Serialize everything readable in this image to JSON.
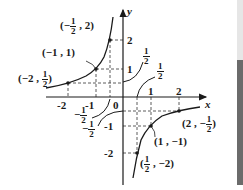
{
  "figure": {
    "title": "",
    "axes": {
      "x_label": "x",
      "y_label": "y",
      "origin_label": "0",
      "x_ticks": [
        "-2",
        "-1",
        "1",
        "2"
      ],
      "y_ticks": [
        "2",
        "1",
        "-1",
        "-2"
      ]
    },
    "curves": [
      {
        "name": "y = -1/x (left branch)",
        "points": [
          [
            -2,
            0.5
          ],
          [
            -1,
            1
          ],
          [
            -0.5,
            2
          ]
        ]
      },
      {
        "name": "y = -1/x (right branch)",
        "points": [
          [
            0.5,
            -2
          ],
          [
            1,
            -1
          ],
          [
            2,
            -0.5
          ]
        ]
      },
      {
        "name": "y = -1/(2x) (left branch)",
        "label": "-1/2"
      },
      {
        "name": "y = -1/(2x) (right branch)",
        "label": "-1/2"
      },
      {
        "name": "y = 1/(2x) (upper branch)",
        "label": "1/2"
      },
      {
        "name": "y = 1/(2x) upper-right branch",
        "label": "1/2"
      }
    ],
    "point_labels": {
      "p1": {
        "open": "(",
        "pre": "−",
        "num": "1",
        "den": "2",
        "sep": ",",
        "y": "2",
        "close": ")"
      },
      "p2": "(−1 , 1)",
      "p3": {
        "open": "(",
        "x": "−2",
        "sep": ",",
        "num": "1",
        "den": "2",
        "close": ")"
      },
      "p4": "(1 , −1)",
      "p5": {
        "open": "(",
        "x": "2",
        "sep": ",",
        "pre": "−",
        "num": "1",
        "den": "2",
        "close": ")"
      },
      "p6": {
        "open": "(",
        "num": "1",
        "den": "2",
        "sep": ",",
        "y": "−2",
        "close": ")"
      }
    },
    "curve_labels": {
      "half_a": {
        "num": "1",
        "den": "2"
      },
      "half_b": {
        "num": "1",
        "den": "2"
      },
      "neg_half_a": {
        "pre": "−",
        "num": "1",
        "den": "2"
      },
      "neg_half_b": {
        "pre": "−",
        "num": "1",
        "den": "2"
      }
    },
    "edge_strip": {
      "top_color": "#e6e6e6",
      "bottom_color": "#6b6b6b"
    }
  }
}
